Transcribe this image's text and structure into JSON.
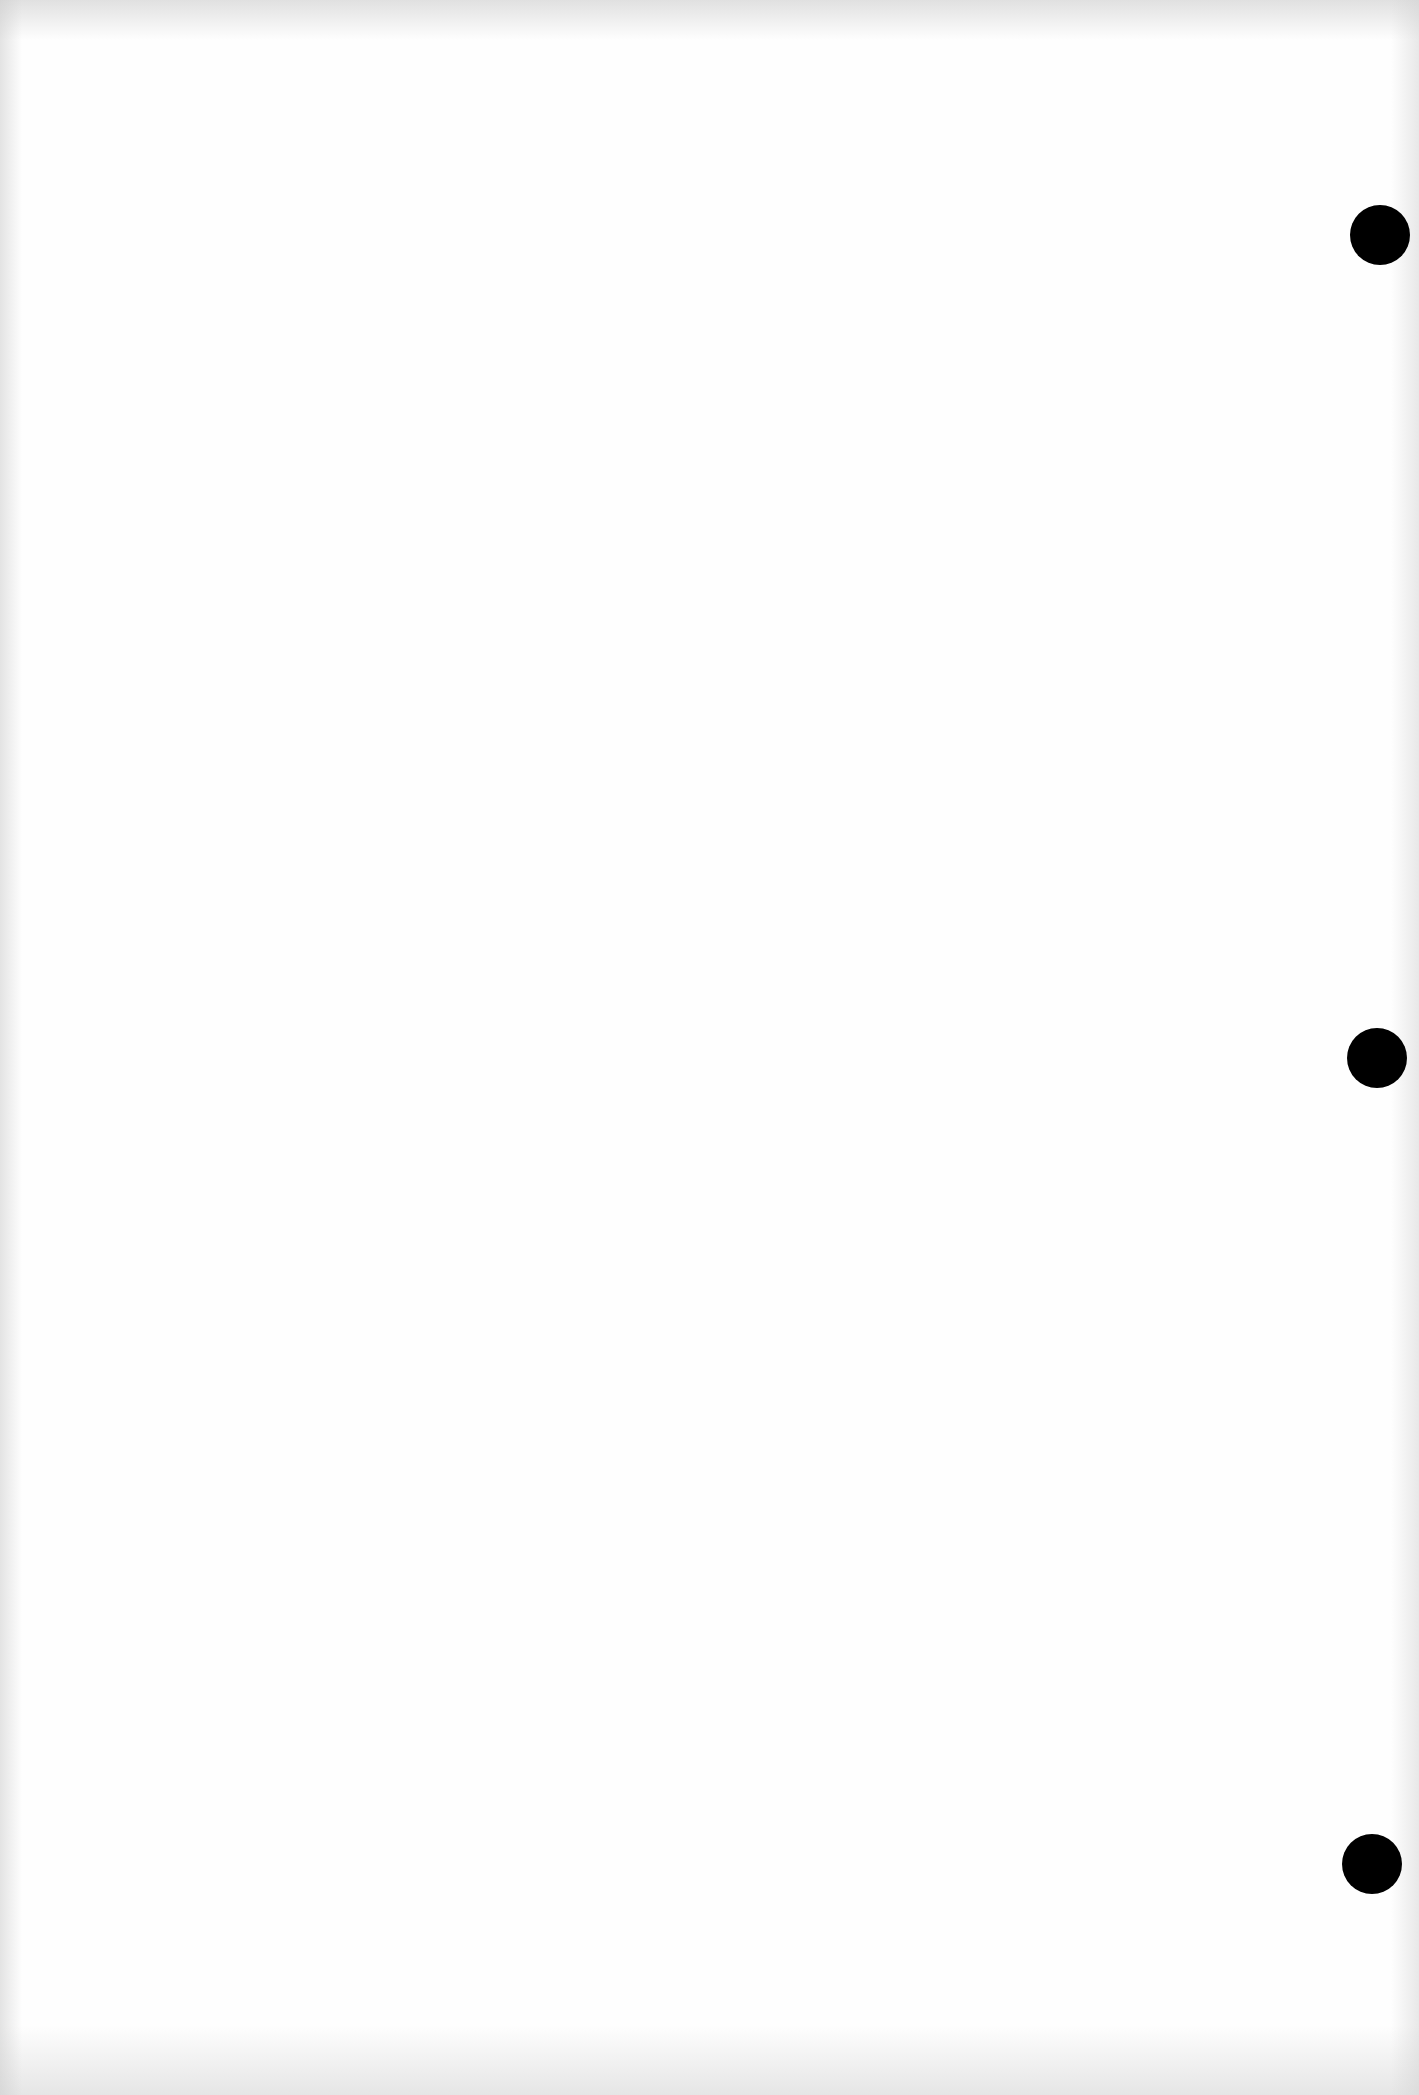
{
  "page": {
    "background_color": "#fefefe",
    "content_text": ""
  },
  "punch_holes": [
    {
      "label": "top-hole",
      "center_x": 1380,
      "center_y": 235,
      "diameter": 60,
      "color": "#000000"
    },
    {
      "label": "middle-hole",
      "center_x": 1377,
      "center_y": 1058,
      "diameter": 60,
      "color": "#000000"
    },
    {
      "label": "bottom-hole",
      "center_x": 1372,
      "center_y": 1864,
      "diameter": 60,
      "color": "#000000"
    }
  ]
}
